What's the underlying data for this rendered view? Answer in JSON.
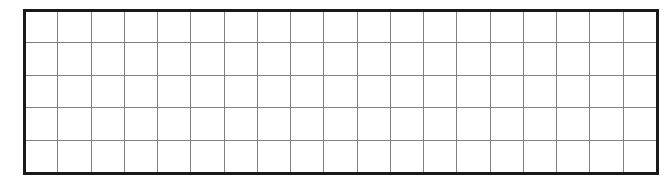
{
  "figure": {
    "type": "blank-grid",
    "title": "",
    "caption": "",
    "background_color": "#ffffff"
  },
  "grid": {
    "name": "blank-ruled-grid",
    "columns": 19,
    "rows": 5,
    "cell_width_px": 33.3,
    "cell_height_px": 32.6,
    "origin_x_px": 24,
    "origin_y_px": 10,
    "width_px": 633,
    "height_px": 163,
    "cell_text": "",
    "interior_line_color": "#7f7f7f",
    "interior_line_width_px": 1.4,
    "border_color": "#1a1a1a",
    "border_width_px": 3,
    "fill_color": "#ffffff"
  },
  "labels": {
    "column_headers": [],
    "row_headers": [],
    "cells": []
  }
}
